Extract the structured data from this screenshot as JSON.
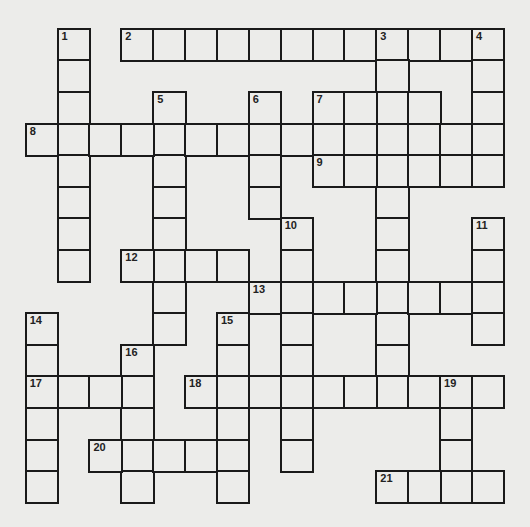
{
  "puzzle": {
    "type": "crossword",
    "grid_rows": 15,
    "grid_cols": 15,
    "colors": {
      "background": "#ececea",
      "cell_fill": "#ececea",
      "grid_line": "#1a1a1a",
      "number_text": "#222222"
    },
    "words": [
      {
        "number": "1",
        "direction": "down",
        "row": 0,
        "col": 1,
        "length": 8
      },
      {
        "number": "2",
        "direction": "across",
        "row": 0,
        "col": 3,
        "length": 12
      },
      {
        "number": "3",
        "direction": "down",
        "row": 0,
        "col": 11,
        "length": 12
      },
      {
        "number": "4",
        "direction": "down",
        "row": 0,
        "col": 14,
        "length": 5
      },
      {
        "number": "5",
        "direction": "down",
        "row": 2,
        "col": 4,
        "length": 8
      },
      {
        "number": "6",
        "direction": "down",
        "row": 2,
        "col": 7,
        "length": 4
      },
      {
        "number": "7",
        "direction": "across",
        "row": 2,
        "col": 9,
        "length": 4
      },
      {
        "number": "8",
        "direction": "across",
        "row": 3,
        "col": 0,
        "length": 15
      },
      {
        "number": "9",
        "direction": "across",
        "row": 4,
        "col": 9,
        "length": 6
      },
      {
        "number": "10",
        "direction": "down",
        "row": 6,
        "col": 8,
        "length": 8
      },
      {
        "number": "11",
        "direction": "down",
        "row": 6,
        "col": 14,
        "length": 4
      },
      {
        "number": "12",
        "direction": "across",
        "row": 7,
        "col": 3,
        "length": 4
      },
      {
        "number": "13",
        "direction": "across",
        "row": 8,
        "col": 7,
        "length": 8
      },
      {
        "number": "14",
        "direction": "down",
        "row": 9,
        "col": 0,
        "length": 6
      },
      {
        "number": "15",
        "direction": "down",
        "row": 9,
        "col": 6,
        "length": 6
      },
      {
        "number": "16",
        "direction": "down",
        "row": 10,
        "col": 3,
        "length": 5
      },
      {
        "number": "17",
        "direction": "across",
        "row": 11,
        "col": 0,
        "length": 4
      },
      {
        "number": "18",
        "direction": "across",
        "row": 11,
        "col": 5,
        "length": 10
      },
      {
        "number": "19",
        "direction": "down",
        "row": 11,
        "col": 13,
        "length": 4
      },
      {
        "number": "20",
        "direction": "across",
        "row": 13,
        "col": 2,
        "length": 5
      },
      {
        "number": "21",
        "direction": "across",
        "row": 14,
        "col": 11,
        "length": 4
      }
    ]
  }
}
